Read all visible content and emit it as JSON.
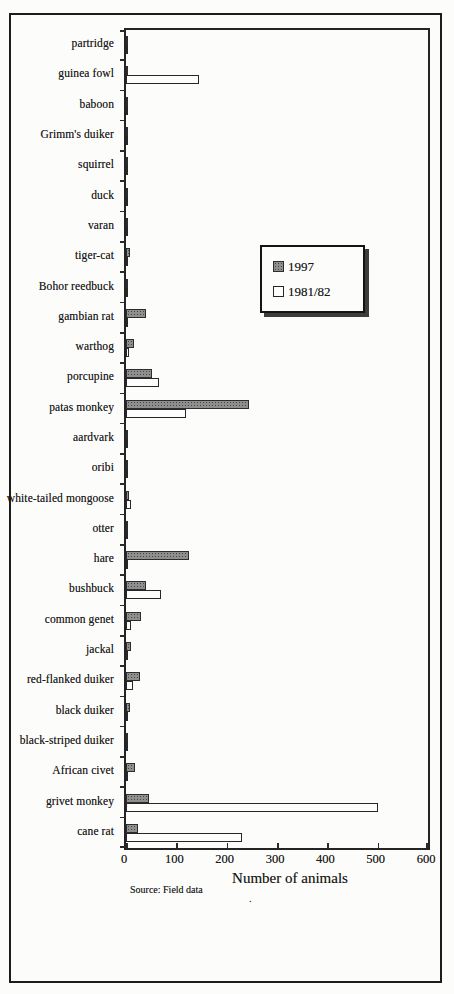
{
  "page": {
    "source_note": "Source: Field data",
    "stray_mark": "."
  },
  "colors": {
    "frame": "#1c1c1c",
    "bar_1997_fill": "#8f8f8f",
    "bar_1997_dot": "#474747",
    "bar_1981_fill": "#fdfdfc",
    "background": "#fcfcfa"
  },
  "chart_data": {
    "type": "bar",
    "orientation": "horizontal",
    "title": "",
    "xlabel": "Number of animals",
    "ylabel": "",
    "xlim": [
      0,
      600
    ],
    "x_ticks": [
      0,
      100,
      200,
      300,
      400,
      500,
      600
    ],
    "grid": false,
    "legend": {
      "position": "inside-upper-right",
      "entries": [
        "1997",
        "1981/82"
      ]
    },
    "categories": [
      "partridge",
      "guinea fowl",
      "baboon",
      "Grimm's duiker",
      "squirrel",
      "duck",
      "varan",
      "tiger-cat",
      "Bohor reedbuck",
      "gambian rat",
      "warthog",
      "porcupine",
      "patas monkey",
      "aardvark",
      "oribi",
      "white-tailed mongoose",
      "otter",
      "hare",
      "bushbuck",
      "common genet",
      "jackal",
      "red-flanked duiker",
      "black duiker",
      "black-striped duiker",
      "African civet",
      "grivet monkey",
      "cane rat"
    ],
    "series": [
      {
        "name": "1997",
        "style": "gray-dotted",
        "values": [
          3,
          4,
          3,
          3,
          3,
          2,
          4,
          8,
          4,
          40,
          15,
          52,
          245,
          3,
          4,
          5,
          2,
          125,
          40,
          30,
          10,
          27,
          7,
          2,
          18,
          45,
          24
        ]
      },
      {
        "name": "1981/82",
        "style": "white-outline",
        "values": [
          2,
          145,
          2,
          2,
          2,
          1,
          2,
          2,
          3,
          3,
          5,
          65,
          120,
          2,
          2,
          10,
          1,
          4,
          70,
          9,
          3,
          13,
          2,
          1,
          2,
          500,
          230
        ]
      }
    ]
  }
}
